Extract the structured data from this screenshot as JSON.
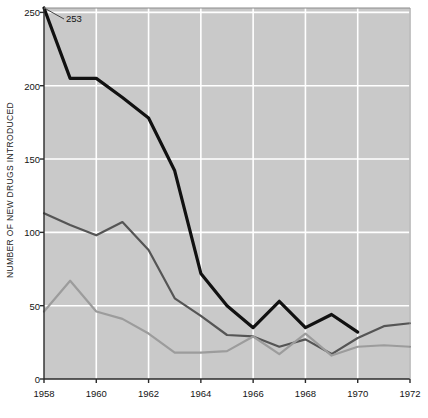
{
  "chart_data": {
    "type": "line",
    "title": "",
    "xlabel": "",
    "ylabel": "NUMBER OF NEW DRUGS INTRODUCED",
    "x": [
      1958,
      1959,
      1960,
      1961,
      1962,
      1963,
      1964,
      1965,
      1966,
      1967,
      1968,
      1969,
      1970,
      1971,
      1972
    ],
    "xlim": [
      1958,
      1972
    ],
    "ylim": [
      0,
      253
    ],
    "xticks": [
      1958,
      1960,
      1962,
      1964,
      1966,
      1968,
      1970,
      1972
    ],
    "xticklabels": [
      "1958",
      "1960",
      "1962",
      "1964",
      "1966",
      "1968",
      "1970",
      "1972"
    ],
    "yticks": [
      0,
      50,
      100,
      150,
      200,
      250
    ],
    "yticklabels": [
      "0",
      "50",
      "100",
      "150",
      "200",
      "250"
    ],
    "grid": true,
    "grid_color": "#ffffff",
    "plot_background": "#c9c9c9",
    "figure_background": "#ffffff",
    "legend": "none",
    "annotations": [
      {
        "text": "253",
        "x": 1958,
        "y": 253,
        "label": "peak-value-callout"
      }
    ],
    "series": [
      {
        "name": "total-new-drugs",
        "color": "#111111",
        "linewidth": 3.2,
        "values": [
          253,
          205,
          205,
          192,
          178,
          142,
          72,
          50,
          35,
          53,
          35,
          44,
          32,
          null,
          null
        ]
      },
      {
        "name": "dark-gray-series",
        "color": "#555555",
        "linewidth": 2.2,
        "values": [
          113,
          105,
          98,
          107,
          88,
          55,
          43,
          30,
          29,
          22,
          27,
          17,
          28,
          36,
          38
        ]
      },
      {
        "name": "light-gray-series",
        "color": "#9c9c9c",
        "linewidth": 2.2,
        "values": [
          46,
          67,
          46,
          41,
          31,
          18,
          18,
          19,
          29,
          17,
          31,
          16,
          22,
          23,
          22
        ]
      }
    ]
  },
  "axes": {
    "ylabel_text": "NUMBER OF NEW DRUGS INTRODUCED",
    "spine_color": "#2a2a2a"
  }
}
